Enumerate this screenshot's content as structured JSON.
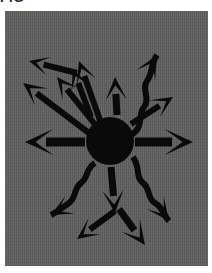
{
  "figure": {
    "caption_clipped": "FIG",
    "background_color": "#5d5d5d",
    "ink_color": "#0a0a0a",
    "page_color": "#ffffff",
    "panel": {
      "x": 5,
      "y": 11,
      "width": 203,
      "height": 255
    },
    "hub": {
      "label": "central-node",
      "cx": 105,
      "cy": 130,
      "r": 24
    },
    "arrow_count": 13,
    "wavy_arrow_count": 3,
    "straight_arrow_count": 10,
    "arrows": [
      {
        "id": "arrow-up-left-long",
        "label": "up-left long arrow",
        "style": "straight",
        "weight": 6,
        "angle_deg": 232,
        "from": {
          "x": 92,
          "y": 116
        },
        "to": {
          "x": 52,
          "y": 66
        },
        "head_size": 16
      },
      {
        "id": "arrow-up-left-steep",
        "label": "up-left steep arrow",
        "style": "straight",
        "weight": 6,
        "angle_deg": 253,
        "from": {
          "x": 96,
          "y": 112
        },
        "to": {
          "x": 74,
          "y": 50
        },
        "head_size": 16
      },
      {
        "id": "arrow-up-short",
        "label": "upward short arrow",
        "style": "straight",
        "weight": 7,
        "angle_deg": 273,
        "from": {
          "x": 112,
          "y": 104
        },
        "to": {
          "x": 110,
          "y": 66
        },
        "head_size": 17
      },
      {
        "id": "arrow-up-left-near-vertical",
        "label": "up-left near vertical arrow",
        "style": "straight",
        "weight": 6,
        "angle_deg": 262,
        "from": {
          "x": 86,
          "y": 106
        },
        "to": {
          "x": 68,
          "y": 58
        },
        "head_size": 15
      },
      {
        "id": "arrow-left-upper-short",
        "label": "left upper short arrow",
        "style": "straight",
        "weight": 6,
        "angle_deg": 200,
        "from": {
          "x": 72,
          "y": 62
        },
        "to": {
          "x": 24,
          "y": 50
        },
        "head_size": 15
      },
      {
        "id": "arrow-left-diagonal-long",
        "label": "left diagonal long arrow",
        "style": "straight",
        "weight": 6,
        "angle_deg": 212,
        "from": {
          "x": 84,
          "y": 122
        },
        "to": {
          "x": 18,
          "y": 72
        },
        "head_size": 17
      },
      {
        "id": "arrow-left-bold",
        "label": "leftward bold arrow",
        "style": "straight",
        "weight": 9,
        "angle_deg": 180,
        "from": {
          "x": 80,
          "y": 131
        },
        "to": {
          "x": 20,
          "y": 131
        },
        "head_size": 21
      },
      {
        "id": "arrow-right-bold",
        "label": "rightward bold arrow",
        "style": "straight",
        "weight": 9,
        "angle_deg": 0,
        "from": {
          "x": 130,
          "y": 131
        },
        "to": {
          "x": 188,
          "y": 131
        },
        "head_size": 21
      },
      {
        "id": "arrow-up-right-short",
        "label": "up-right short arrow",
        "style": "straight",
        "weight": 6,
        "angle_deg": 330,
        "from": {
          "x": 126,
          "y": 113
        },
        "to": {
          "x": 168,
          "y": 86
        },
        "head_size": 16
      },
      {
        "id": "arrow-down-center",
        "label": "downward center arrow",
        "style": "straight",
        "weight": 7,
        "angle_deg": 85,
        "from": {
          "x": 106,
          "y": 156
        },
        "to": {
          "x": 110,
          "y": 202
        },
        "head_size": 17
      },
      {
        "id": "arrow-down-left",
        "label": "down-left arrow",
        "style": "straight",
        "weight": 6,
        "angle_deg": 138,
        "from": {
          "x": 110,
          "y": 200
        },
        "to": {
          "x": 72,
          "y": 228
        },
        "head_size": 16
      },
      {
        "id": "arrow-down-right",
        "label": "down-right arrow",
        "style": "straight",
        "weight": 7,
        "angle_deg": 52,
        "from": {
          "x": 114,
          "y": 198
        },
        "to": {
          "x": 140,
          "y": 234
        },
        "head_size": 18
      },
      {
        "id": "arrow-wavy-up-right",
        "label": "wavy arrow up-right",
        "style": "wavy",
        "weight": 6,
        "path": "M 126,124 C 140,116 132,104 139,96 C 146,88 136,78 142,70 C 148,62 145,54 152,44",
        "head_size": 17
      },
      {
        "id": "arrow-wavy-down-right",
        "label": "wavy arrow down-right",
        "style": "wavy",
        "weight": 6,
        "path": "M 128,146 C 136,158 130,166 138,172 C 146,178 142,188 150,192 C 158,196 158,204 164,210",
        "head_size": 17
      },
      {
        "id": "arrow-wavy-down-left",
        "label": "wavy arrow down-left",
        "style": "wavy",
        "weight": 6,
        "path": "M 90,152 C 80,158 84,166 76,172 C 68,178 72,186 64,192 C 56,198 54,200 46,204",
        "head_size": 16
      }
    ]
  }
}
